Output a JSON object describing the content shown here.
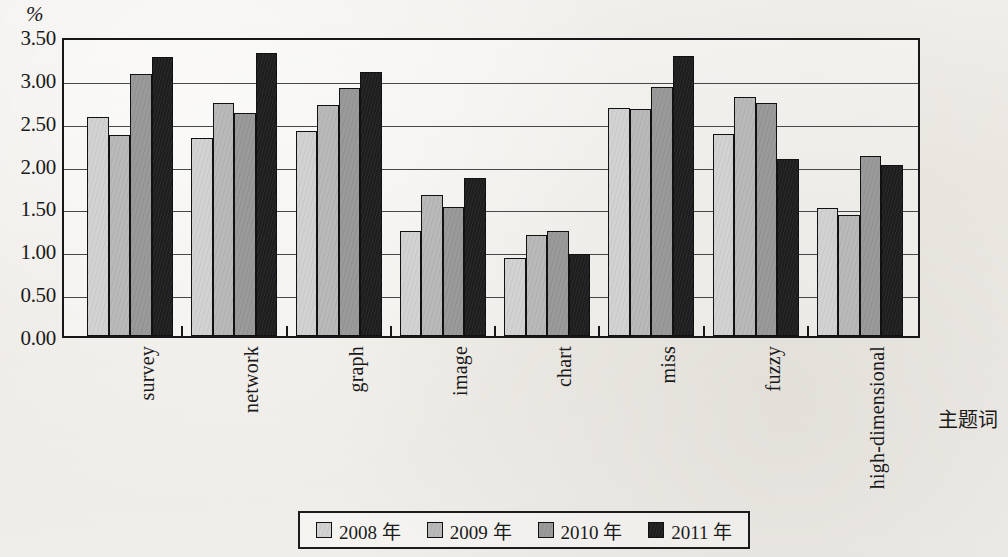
{
  "chart_data": {
    "type": "bar",
    "title": "",
    "xlabel": "主题词",
    "ylabel": "%",
    "ylim": [
      0.0,
      3.5
    ],
    "grid": true,
    "legend_position": "bottom",
    "ytick_labels": [
      "3.50",
      "3.00",
      "2.50",
      "2.00",
      "1.50",
      "1.00",
      "0.50",
      "0.00"
    ],
    "ytick_values": [
      3.5,
      3.0,
      2.5,
      2.0,
      1.5,
      1.0,
      0.5,
      0.0
    ],
    "categories": [
      "survey",
      "network",
      "graph",
      "image",
      "chart",
      "miss",
      "fuzzy",
      "high-dimensional"
    ],
    "series": [
      {
        "name": "2008 年",
        "color": "#d2d2d2",
        "values": [
          2.55,
          2.31,
          2.39,
          1.23,
          0.91,
          2.66,
          2.36,
          1.49
        ]
      },
      {
        "name": "2009 年",
        "color": "#b9b9b9",
        "values": [
          2.34,
          2.72,
          2.7,
          1.64,
          1.18,
          2.65,
          2.79,
          1.41
        ]
      },
      {
        "name": "2010 年",
        "color": "#9a9a9a",
        "values": [
          3.06,
          2.6,
          2.89,
          1.51,
          1.23,
          2.9,
          2.72,
          2.1
        ]
      },
      {
        "name": "2011 年",
        "color": "#1e1e1e",
        "values": [
          3.25,
          3.3,
          3.08,
          1.84,
          0.96,
          3.27,
          2.06,
          2.0
        ]
      }
    ]
  }
}
